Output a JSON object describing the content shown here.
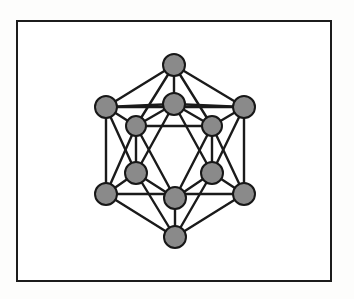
{
  "figure": {
    "title": "Icosahedron ball-and-stick cluster diagram",
    "caption": "",
    "canvas": {
      "width": 354,
      "height": 299
    },
    "background_color": "#fdfdfc",
    "frame": {
      "name": "figure-border",
      "x": 17,
      "y": 21,
      "width": 314,
      "height": 260,
      "stroke_color": "#1c1c1c",
      "stroke_width": 2,
      "fill_color": "#ffffff"
    },
    "style": {
      "node_fill": "#8a8a8a",
      "node_stroke": "#171717",
      "node_stroke_width": 2,
      "node_radius": 11,
      "inner_node_radius": 10,
      "edge_color": "#1a1a1a",
      "edge_width": 2.4,
      "hidden_edge_width": 1.8
    },
    "geometry_name": "icosahedron",
    "vertex_count": 12,
    "edge_count": 30,
    "nodes": [
      {
        "id": "v0",
        "label": "top-apex",
        "x": 174,
        "y": 65,
        "r": 11
      },
      {
        "id": "v1",
        "label": "upper-outer-left",
        "x": 106,
        "y": 107,
        "r": 11
      },
      {
        "id": "v2",
        "label": "upper-outer-right",
        "x": 244,
        "y": 107,
        "r": 11
      },
      {
        "id": "v3",
        "label": "upper-inner-center",
        "x": 174,
        "y": 104,
        "r": 11
      },
      {
        "id": "v4",
        "label": "upper-inner-left",
        "x": 136,
        "y": 126,
        "r": 10
      },
      {
        "id": "v5",
        "label": "upper-inner-right",
        "x": 212,
        "y": 126,
        "r": 10
      },
      {
        "id": "v6",
        "label": "lower-inner-left",
        "x": 136,
        "y": 173,
        "r": 11
      },
      {
        "id": "v7",
        "label": "lower-inner-right",
        "x": 212,
        "y": 173,
        "r": 11
      },
      {
        "id": "v8",
        "label": "lower-inner-center",
        "x": 175,
        "y": 198,
        "r": 11
      },
      {
        "id": "v9",
        "label": "lower-outer-left",
        "x": 106,
        "y": 194,
        "r": 11
      },
      {
        "id": "v10",
        "label": "lower-outer-right",
        "x": 244,
        "y": 194,
        "r": 11
      },
      {
        "id": "v11",
        "label": "bottom-apex",
        "x": 175,
        "y": 237,
        "r": 11
      }
    ],
    "edges": [
      {
        "from": "v0",
        "to": "v1"
      },
      {
        "from": "v0",
        "to": "v2"
      },
      {
        "from": "v0",
        "to": "v3"
      },
      {
        "from": "v0",
        "to": "v4"
      },
      {
        "from": "v0",
        "to": "v5"
      },
      {
        "from": "v1",
        "to": "v2"
      },
      {
        "from": "v1",
        "to": "v3"
      },
      {
        "from": "v1",
        "to": "v4"
      },
      {
        "from": "v1",
        "to": "v6"
      },
      {
        "from": "v1",
        "to": "v9"
      },
      {
        "from": "v2",
        "to": "v3"
      },
      {
        "from": "v2",
        "to": "v5"
      },
      {
        "from": "v2",
        "to": "v7"
      },
      {
        "from": "v2",
        "to": "v10"
      },
      {
        "from": "v3",
        "to": "v4"
      },
      {
        "from": "v3",
        "to": "v5"
      },
      {
        "from": "v3",
        "to": "v6"
      },
      {
        "from": "v3",
        "to": "v7"
      },
      {
        "from": "v4",
        "to": "v5"
      },
      {
        "from": "v4",
        "to": "v6"
      },
      {
        "from": "v4",
        "to": "v8"
      },
      {
        "from": "v5",
        "to": "v7"
      },
      {
        "from": "v5",
        "to": "v8"
      },
      {
        "from": "v6",
        "to": "v8"
      },
      {
        "from": "v6",
        "to": "v9"
      },
      {
        "from": "v6",
        "to": "v11"
      },
      {
        "from": "v7",
        "to": "v8"
      },
      {
        "from": "v7",
        "to": "v10"
      },
      {
        "from": "v7",
        "to": "v11"
      },
      {
        "from": "v8",
        "to": "v11"
      },
      {
        "from": "v9",
        "to": "v10"
      },
      {
        "from": "v9",
        "to": "v11"
      },
      {
        "from": "v10",
        "to": "v11"
      },
      {
        "from": "v4",
        "to": "v9"
      },
      {
        "from": "v5",
        "to": "v10"
      }
    ]
  }
}
